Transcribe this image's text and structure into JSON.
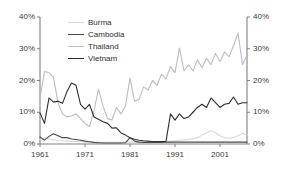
{
  "chart_data": {
    "type": "line",
    "title": "",
    "xlabel": "",
    "ylabel": "",
    "xlim": [
      1961,
      2007
    ],
    "ylim": [
      0,
      40
    ],
    "grid": false,
    "legend_position": "top-left-inside",
    "dual_y_axis": true,
    "y_tick_labels": [
      "0%",
      "10%",
      "20%",
      "30%",
      "40%"
    ],
    "y_tick_values": [
      0,
      10,
      20,
      30,
      40
    ],
    "y_tick_labels_right": [
      "0%",
      "10%",
      "20%",
      "30%",
      "40%"
    ],
    "x_tick_labels": [
      "1961",
      "1971",
      "1981",
      "1991",
      "2001"
    ],
    "x_tick_values": [
      1961,
      1971,
      1981,
      1991,
      2001
    ],
    "x": [
      1961,
      1962,
      1963,
      1964,
      1965,
      1966,
      1967,
      1968,
      1969,
      1970,
      1971,
      1972,
      1973,
      1974,
      1975,
      1976,
      1977,
      1978,
      1979,
      1980,
      1981,
      1982,
      1983,
      1984,
      1985,
      1986,
      1987,
      1988,
      1989,
      1990,
      1991,
      1992,
      1993,
      1994,
      1995,
      1996,
      1997,
      1998,
      1999,
      2000,
      2001,
      2002,
      2003,
      2004,
      2005,
      2006,
      2007
    ],
    "series": [
      {
        "name": "Burma",
        "color": "#d8d8d8",
        "values": [
          1.5,
          2.0,
          1.6,
          1.3,
          1.1,
          1.0,
          0.9,
          0.8,
          0.8,
          0.7,
          0.6,
          0.6,
          0.5,
          0.5,
          0.5,
          0.5,
          0.5,
          0.5,
          0.5,
          0.6,
          0.6,
          0.6,
          0.6,
          0.6,
          0.6,
          0.6,
          0.6,
          0.6,
          0.7,
          0.8,
          1.0,
          1.2,
          1.3,
          1.5,
          1.6,
          2.0,
          2.8,
          3.5,
          4.2,
          3.6,
          2.6,
          2.0,
          1.8,
          2.0,
          2.6,
          3.4,
          2.8
        ]
      },
      {
        "name": "Cambodia",
        "color": "#4a4a4a",
        "values": [
          2.2,
          1.2,
          2.4,
          3.2,
          2.6,
          2.0,
          2.0,
          1.6,
          1.4,
          1.2,
          0.9,
          0.7,
          0.5,
          0.4,
          0.3,
          0.3,
          0.3,
          0.3,
          0.3,
          0.4,
          2.0,
          0.9,
          0.6,
          0.5,
          0.5,
          0.5,
          0.5,
          0.5,
          0.6,
          0.6,
          0.6,
          0.6,
          0.6,
          0.6,
          0.6,
          0.6,
          0.6,
          0.6,
          0.6,
          0.6,
          0.6,
          0.6,
          0.6,
          0.6,
          0.6,
          0.6,
          0.6
        ]
      },
      {
        "name": "Thailand",
        "color": "#bdbdbd",
        "values": [
          14.5,
          22.8,
          22.5,
          21.0,
          13.0,
          9.5,
          8.5,
          8.8,
          9.5,
          8.0,
          6.5,
          5.5,
          10.5,
          17.2,
          12.0,
          8.0,
          7.6,
          11.5,
          9.5,
          12.0,
          20.8,
          13.5,
          14.0,
          18.0,
          17.0,
          20.0,
          18.5,
          22.0,
          20.5,
          24.5,
          22.5,
          30.2,
          23.0,
          25.0,
          23.0,
          26.5,
          24.0,
          27.0,
          25.0,
          28.5,
          26.0,
          29.0,
          27.5,
          31.0,
          35.0,
          25.0,
          28.0
        ]
      },
      {
        "name": "Vietnam",
        "color": "#2e2e2e",
        "values": [
          9.8,
          6.5,
          14.5,
          13.2,
          13.5,
          12.8,
          16.5,
          19.2,
          18.5,
          12.5,
          11.0,
          12.5,
          8.5,
          7.8,
          7.0,
          6.5,
          5.0,
          5.1,
          3.5,
          2.8,
          2.0,
          1.5,
          1.2,
          1.0,
          0.9,
          0.8,
          0.8,
          0.8,
          0.8,
          9.5,
          7.5,
          9.5,
          8.0,
          8.5,
          10.0,
          11.5,
          12.5,
          11.5,
          14.5,
          13.0,
          11.5,
          12.5,
          12.8,
          14.8,
          12.5,
          13.0,
          13.0
        ]
      }
    ]
  }
}
